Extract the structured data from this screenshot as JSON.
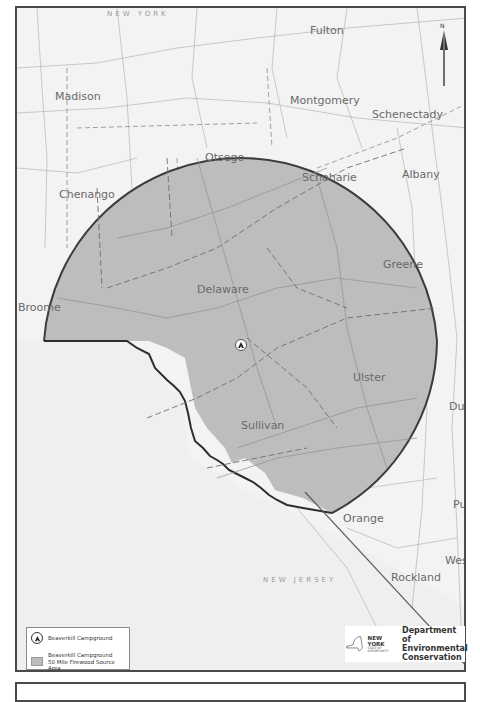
{
  "map": {
    "state_labels": {
      "new_york": "NEW YORK",
      "new_jersey": "NEW JERSEY"
    },
    "county_labels": [
      {
        "name": "Madison",
        "x": 38,
        "y": 82
      },
      {
        "name": "Fulton",
        "x": 293,
        "y": 16
      },
      {
        "name": "Montgomery",
        "x": 273,
        "y": 86
      },
      {
        "name": "Schenectady",
        "x": 355,
        "y": 100
      },
      {
        "name": "Otsego",
        "x": 188,
        "y": 143
      },
      {
        "name": "Schoharie",
        "x": 285,
        "y": 163
      },
      {
        "name": "Albany",
        "x": 385,
        "y": 160
      },
      {
        "name": "Chenango",
        "x": 42,
        "y": 180
      },
      {
        "name": "Greene",
        "x": 366,
        "y": 250
      },
      {
        "name": "Delaware",
        "x": 180,
        "y": 275
      },
      {
        "name": "Broome",
        "x": 1,
        "y": 293
      },
      {
        "name": "Ulster",
        "x": 336,
        "y": 363
      },
      {
        "name": "Dutc",
        "x": 446,
        "y": 392
      },
      {
        "name": "Sullivan",
        "x": 224,
        "y": 411
      },
      {
        "name": "Orange",
        "x": 326,
        "y": 504
      },
      {
        "name": "Putr",
        "x": 450,
        "y": 490
      },
      {
        "name": "Westc",
        "x": 442,
        "y": 546
      },
      {
        "name": "Rockland",
        "x": 374,
        "y": 563
      }
    ],
    "north_arrow_label": "N",
    "campground_marker": "campground-icon"
  },
  "legend": {
    "items": [
      {
        "icon": "campground-icon",
        "label": "Beaverkill Campground"
      },
      {
        "icon": "source-area-swatch",
        "label_line1": "Beaverkill Campground",
        "label_line2": "50 Mile Firewood Source Area"
      }
    ]
  },
  "logo": {
    "state_name": "NEW YORK",
    "state_tagline_1": "STATE OF",
    "state_tagline_2": "OPPORTUNITY",
    "department_line1": "Department of",
    "department_line2": "Environmental",
    "department_line3": "Conservation"
  },
  "colors": {
    "source_area_fill": "#bdbdbd",
    "background": "#f1f1f1",
    "border": "#4a4a4a"
  }
}
